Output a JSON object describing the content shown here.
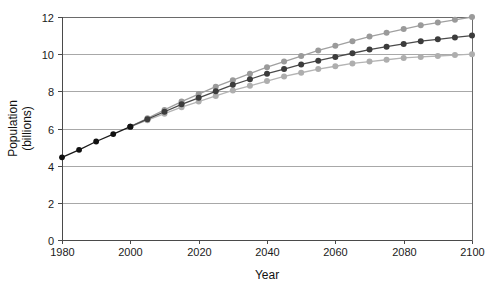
{
  "chart_data": {
    "type": "line",
    "title": "",
    "xlabel": "Year",
    "ylabel": "Population (billions)",
    "ylabel_line1": "Population",
    "ylabel_line2": "(billions)",
    "xlim": [
      1980,
      2100
    ],
    "ylim": [
      0,
      12
    ],
    "xticks": [
      1980,
      2000,
      2020,
      2040,
      2060,
      2080,
      2100
    ],
    "yticks": [
      0,
      2,
      4,
      6,
      8,
      10,
      12
    ],
    "xtick_labels": [
      "1980",
      "2000",
      "2020",
      "2040",
      "2060",
      "2080",
      "2100"
    ],
    "ytick_labels": [
      "0",
      "2",
      "4",
      "6",
      "8",
      "10",
      "12"
    ],
    "grid": "horizontal",
    "legend": "none",
    "x": [
      1980,
      1985,
      1990,
      1995,
      2000,
      2005,
      2010,
      2015,
      2020,
      2025,
      2030,
      2035,
      2040,
      2045,
      2050,
      2055,
      2060,
      2065,
      2070,
      2075,
      2080,
      2085,
      2090,
      2095,
      2100
    ],
    "series": [
      {
        "name": "historical",
        "color": "#1a1a1a",
        "marker_color": "#111111",
        "x": [
          1980,
          1985,
          1990,
          1995,
          2000
        ],
        "values": [
          4.45,
          4.85,
          5.3,
          5.7,
          6.1
        ]
      },
      {
        "name": "high-projection",
        "color": "#a0a0a0",
        "marker_color": "#9a9a9a",
        "x": [
          2000,
          2005,
          2010,
          2015,
          2020,
          2025,
          2030,
          2035,
          2040,
          2045,
          2050,
          2055,
          2060,
          2065,
          2070,
          2075,
          2080,
          2085,
          2090,
          2095,
          2100
        ],
        "values": [
          6.1,
          6.55,
          7.0,
          7.45,
          7.85,
          8.25,
          8.6,
          8.95,
          9.3,
          9.6,
          9.9,
          10.2,
          10.45,
          10.7,
          10.95,
          11.15,
          11.35,
          11.55,
          11.7,
          11.85,
          12.0
        ]
      },
      {
        "name": "medium-projection",
        "color": "#4a4a4a",
        "marker_color": "#3c3c3c",
        "x": [
          2000,
          2005,
          2010,
          2015,
          2020,
          2025,
          2030,
          2035,
          2040,
          2045,
          2050,
          2055,
          2060,
          2065,
          2070,
          2075,
          2080,
          2085,
          2090,
          2095,
          2100
        ],
        "values": [
          6.1,
          6.5,
          6.9,
          7.3,
          7.65,
          8.0,
          8.35,
          8.65,
          8.95,
          9.2,
          9.45,
          9.65,
          9.85,
          10.05,
          10.25,
          10.4,
          10.55,
          10.7,
          10.8,
          10.9,
          11.0
        ]
      },
      {
        "name": "low-projection",
        "color": "#b4b4b4",
        "marker_color": "#aeaeae",
        "x": [
          2000,
          2005,
          2010,
          2015,
          2020,
          2025,
          2030,
          2035,
          2040,
          2045,
          2050,
          2055,
          2060,
          2065,
          2070,
          2075,
          2080,
          2085,
          2090,
          2095,
          2100
        ],
        "values": [
          6.1,
          6.45,
          6.8,
          7.15,
          7.45,
          7.75,
          8.05,
          8.3,
          8.55,
          8.8,
          9.0,
          9.2,
          9.35,
          9.5,
          9.6,
          9.7,
          9.8,
          9.85,
          9.9,
          9.95,
          10.0
        ]
      }
    ]
  },
  "colors": {
    "gridline": "#a8a8a8",
    "axis": "#4a4a4a",
    "background": "#ffffff",
    "historical": "#1a1a1a",
    "high": "#a0a0a0",
    "medium": "#4a4a4a",
    "low": "#b4b4b4"
  }
}
